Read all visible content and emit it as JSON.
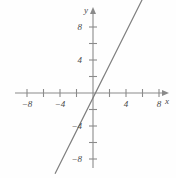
{
  "chart_data": {
    "type": "line",
    "title": "",
    "xlabel": "x",
    "ylabel": "y",
    "xlim": [
      -10,
      10
    ],
    "ylim": [
      -10,
      10
    ],
    "grid": false,
    "legend": null,
    "x_ticks": [
      -8,
      -6,
      -4,
      -2,
      2,
      4,
      6,
      8
    ],
    "y_ticks": [
      8,
      6,
      4,
      2,
      -2,
      -4,
      -6,
      -8
    ],
    "x_tick_labels": [
      {
        "value": -8,
        "text": "−8"
      },
      {
        "value": -4,
        "text": "−4"
      },
      {
        "value": 4,
        "text": "4"
      },
      {
        "value": 8,
        "text": "8"
      }
    ],
    "y_tick_labels": [
      {
        "value": 8,
        "text": "8"
      },
      {
        "value": 4,
        "text": "4"
      },
      {
        "value": -4,
        "text": "−4"
      },
      {
        "value": -8,
        "text": "−8"
      }
    ],
    "series": [
      {
        "name": "line",
        "slope": 2,
        "intercept": -0.6,
        "x": [
          -4.6,
          6.9
        ],
        "y": [
          -9.8,
          13.2
        ],
        "color": "#7d7d7d"
      }
    ],
    "axis_color": "#8a8a8a",
    "background_color": "#fefefe"
  },
  "axes": {
    "x_axis_label": "x",
    "y_axis_label": "y"
  }
}
